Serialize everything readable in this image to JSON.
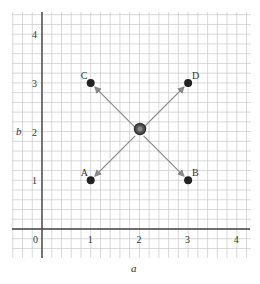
{
  "diagram": {
    "x_axis": {
      "label": "a",
      "ticks": [
        "0",
        "1",
        "2",
        "3",
        "4"
      ]
    },
    "y_axis": {
      "label": "b",
      "ticks": [
        "1",
        "2",
        "3",
        "4"
      ]
    },
    "center": {
      "a": 2,
      "b": 2
    },
    "points": [
      {
        "name": "A",
        "a": 1,
        "b": 1
      },
      {
        "name": "B",
        "a": 3,
        "b": 1
      },
      {
        "name": "C",
        "a": 1,
        "b": 3
      },
      {
        "name": "D",
        "a": 3,
        "b": 3
      }
    ],
    "arrows": [
      "center→A",
      "center→B",
      "center→C",
      "center→D"
    ],
    "colors": {
      "grid": "#c8c8c8",
      "axis": "#444444",
      "point": "#222222",
      "arrow": "#888888"
    }
  }
}
